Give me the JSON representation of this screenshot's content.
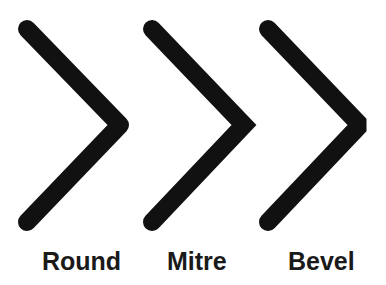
{
  "diagram": {
    "stroke_color": "#111111",
    "stroke_width": 18,
    "joins": [
      {
        "label": "Round",
        "linejoin": "round",
        "points": "27,29 120,125 27,222"
      },
      {
        "label": "Mitre",
        "linejoin": "miter",
        "points": "152,29 244,125 152,222"
      },
      {
        "label": "Bevel",
        "linejoin": "bevel",
        "points": "268,29 360,125 268,222"
      }
    ]
  }
}
